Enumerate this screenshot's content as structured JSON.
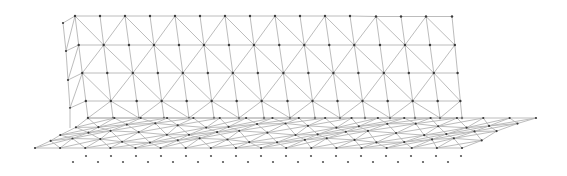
{
  "figure": {
    "colors": {
      "background": "#ffffff",
      "edge": "#b4b4b4",
      "node": "#3a3a3a",
      "point": "#555555"
    }
  },
  "wall": {
    "columns_x_top": [
      75,
      100,
      125,
      150,
      175,
      200,
      225,
      250,
      275,
      300,
      325,
      350,
      376,
      401,
      426,
      452
    ],
    "columns_x_bottom": [
      88,
      113,
      139,
      164,
      189,
      214,
      239,
      264,
      290,
      315,
      340,
      365,
      390,
      415,
      440,
      462
    ],
    "rows_y": [
      16,
      45,
      73,
      101,
      118
    ],
    "left_fold": {
      "x": [
        63,
        66,
        68,
        70
      ],
      "y": [
        23,
        51,
        80,
        108
      ]
    }
  },
  "floor": {
    "back_y": 118,
    "front_y": 148,
    "back_x": [
      88,
      536
    ],
    "front_x": [
      35,
      462
    ],
    "rows": 5,
    "cols": 18
  },
  "points": {
    "row_a": {
      "y": 156,
      "x_start": 86,
      "x_step": 25,
      "count": 16
    },
    "row_b": {
      "y": 162,
      "x_start": 73,
      "x_step": 25,
      "count": 16
    }
  }
}
